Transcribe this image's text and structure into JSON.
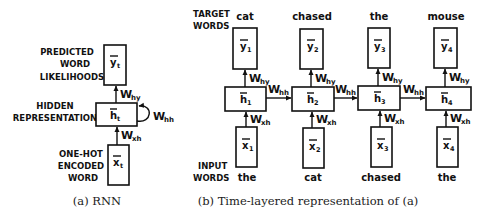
{
  "panel_a": {
    "caption": "(a) RNN",
    "labels": {
      "output": [
        "PREDICTED",
        "WORD",
        "LIKELIHOODS"
      ],
      "hidden": [
        "HIDDEN",
        "REPRESENTATION"
      ],
      "input": [
        "ONE-HOT",
        "ENCODED",
        "WORD"
      ]
    },
    "nodes": {
      "output": {
        "var": "y",
        "sub": "t"
      },
      "hidden": {
        "var": "h",
        "sub": "t"
      },
      "input": {
        "var": "x",
        "sub": "t"
      }
    },
    "weights": {
      "hy": {
        "w": "W",
        "sub": "hy"
      },
      "xh": {
        "w": "W",
        "sub": "xh"
      },
      "hh": {
        "w": "W",
        "sub": "hh"
      }
    }
  },
  "panel_b": {
    "caption": "(b) Time-layered representation of (a)",
    "row_labels": {
      "target": [
        "TARGET",
        "WORDS"
      ],
      "input": [
        "INPUT",
        "WORDS"
      ]
    },
    "steps": [
      {
        "target": "cat",
        "input": "the",
        "y": "y",
        "h": "h",
        "x": "x",
        "sub": "1"
      },
      {
        "target": "chased",
        "input": "cat",
        "y": "y",
        "h": "h",
        "x": "x",
        "sub": "2"
      },
      {
        "target": "the",
        "input": "chased",
        "y": "y",
        "h": "h",
        "x": "x",
        "sub": "3"
      },
      {
        "target": "mouse",
        "input": "the",
        "y": "y",
        "h": "h",
        "x": "x",
        "sub": "4"
      }
    ],
    "weights": {
      "hy": {
        "w": "W",
        "sub": "hy"
      },
      "xh": {
        "w": "W",
        "sub": "xh"
      },
      "hh": {
        "w": "W",
        "sub": "hh"
      }
    }
  }
}
